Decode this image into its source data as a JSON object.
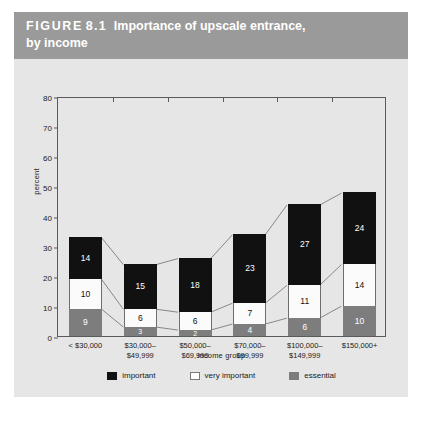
{
  "figure": {
    "label_word": "FIGURE",
    "number": "8.1",
    "title_rest": "Importance of upscale entrance,",
    "title_line2": "by income"
  },
  "chart_data": {
    "type": "bar",
    "subtype": "stacked",
    "title": "Importance of upscale entrance, by income",
    "xlabel": "income group",
    "ylabel": "percent",
    "ylim": [
      0,
      80
    ],
    "yticks": [
      0,
      10,
      20,
      30,
      40,
      50,
      60,
      70,
      80
    ],
    "grid": false,
    "legend_position": "bottom",
    "categories": [
      "< $30,000",
      "$30,000–\n$49,999",
      "$50,000–\n$69,999",
      "$70,000–\n$99,999",
      "$100,000–\n$149,999",
      "$150,000+"
    ],
    "category_lines": [
      [
        "< $30,000",
        ""
      ],
      [
        "$30,000–",
        "$49,999"
      ],
      [
        "$50,000–",
        "$69,999"
      ],
      [
        "$70,000–",
        "$99,999"
      ],
      [
        "$100,000–",
        "$149,999"
      ],
      [
        "$150,000+",
        ""
      ]
    ],
    "series": [
      {
        "name": "essential",
        "color": "#7d7d7d",
        "values": [
          9,
          3,
          2,
          4,
          6,
          10
        ]
      },
      {
        "name": "very important",
        "color": "#ffffff",
        "values": [
          10,
          6,
          6,
          7,
          11,
          14
        ]
      },
      {
        "name": "important",
        "color": "#111111",
        "values": [
          14,
          15,
          18,
          23,
          27,
          24
        ]
      }
    ],
    "stack_totals": [
      33,
      24,
      26,
      34,
      44,
      48
    ],
    "legend": [
      {
        "label": "important",
        "color": "#111111"
      },
      {
        "label": "very important",
        "color": "#ffffff"
      },
      {
        "label": "essential",
        "color": "#7d7d7d"
      }
    ]
  },
  "colors": {
    "header_background": "#9a9a9a",
    "figure_background": "#e6e6e6",
    "axis": "#5a5a5a",
    "important": "#111111",
    "very_important": "#ffffff",
    "essential": "#7d7d7d"
  }
}
